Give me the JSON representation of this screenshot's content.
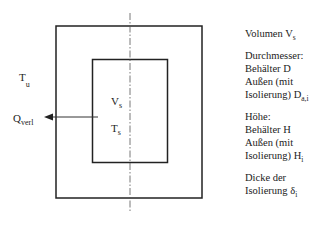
{
  "diagram": {
    "labels": {
      "ambient_temp": {
        "main": "T",
        "sub": "u"
      },
      "heat_loss": {
        "main": "Q",
        "sub": "verl"
      },
      "storage_volume": {
        "main": "V",
        "sub": "s"
      },
      "storage_temp": {
        "main": "T",
        "sub": "s"
      }
    },
    "colors": {
      "stroke": "#222222",
      "arrow": "#333333"
    }
  },
  "legend": {
    "volume": {
      "text": "Volumen V",
      "sub": "s"
    },
    "diameter": {
      "title": "Durchmesser:",
      "line1": "Behälter D",
      "line2": "Außen (mit",
      "line3": "Isolierung) D",
      "line3_sub": "a,i"
    },
    "height": {
      "title": "Höhe:",
      "line1": "Behälter H",
      "line2": "Außen (mit",
      "line3": "Isolierung) H",
      "line3_sub": "i"
    },
    "insulation": {
      "line1": "Dicke der",
      "line2": "Isolierung δ",
      "line2_sub": "i"
    }
  }
}
